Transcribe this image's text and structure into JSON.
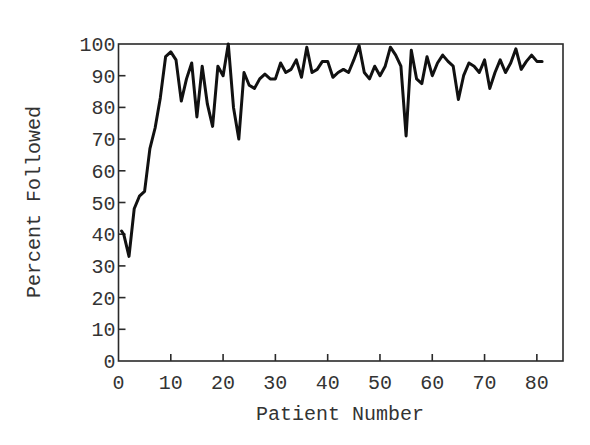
{
  "chart_data": {
    "type": "line",
    "title": "",
    "xlabel": "Patient Number",
    "ylabel": "Percent Followed",
    "xlim": [
      0,
      85
    ],
    "ylim": [
      0,
      100
    ],
    "xticks": [
      0,
      10,
      20,
      30,
      40,
      50,
      60,
      70,
      80
    ],
    "yticks": [
      0,
      10,
      20,
      30,
      40,
      50,
      60,
      70,
      80,
      90,
      100
    ],
    "grid": false,
    "legend": null,
    "series": [
      {
        "name": "Percent Followed",
        "color": "#111111",
        "x": [
          0.6,
          1,
          2,
          3,
          4,
          5,
          6,
          7,
          8,
          9,
          10,
          11,
          12,
          13,
          14,
          15,
          16,
          17,
          18,
          19,
          20,
          21,
          22,
          23,
          24,
          25,
          26,
          27,
          28,
          29,
          30,
          31,
          32,
          33,
          34,
          35,
          36,
          37,
          38,
          39,
          40,
          41,
          42,
          43,
          44,
          45,
          46,
          47,
          48,
          49,
          50,
          51,
          52,
          53,
          54,
          55,
          56,
          57,
          58,
          59,
          60,
          61,
          62,
          63,
          64,
          65,
          66,
          67,
          68,
          69,
          70,
          71,
          72,
          73,
          74,
          75,
          76,
          77,
          78,
          79,
          80,
          81
        ],
        "values": [
          41,
          40,
          33,
          48,
          52,
          53.5,
          67,
          73.5,
          83,
          96,
          97.5,
          95,
          82,
          89,
          94,
          77,
          93,
          81,
          74,
          93,
          90,
          100,
          80,
          70,
          91,
          87,
          86,
          89,
          90.5,
          89,
          89,
          94,
          91,
          92,
          95,
          89.5,
          99,
          91,
          92,
          94.5,
          94.5,
          89.5,
          91,
          92,
          91,
          95,
          99.5,
          91,
          89,
          93,
          90,
          93,
          99,
          96.5,
          93,
          71,
          98,
          89,
          87.5,
          96,
          90,
          94,
          96.5,
          94.5,
          93,
          82.5,
          90,
          94,
          93,
          91,
          95,
          86,
          91,
          95,
          91,
          94,
          98.5,
          92,
          94.5,
          96.5,
          94.5,
          94.5
        ]
      }
    ]
  },
  "axes": {
    "x_title": "Patient Number",
    "y_title": "Percent Followed",
    "x_tick_labels": [
      "0",
      "10",
      "20",
      "30",
      "40",
      "50",
      "60",
      "70",
      "80"
    ],
    "y_tick_labels": [
      "0",
      "10",
      "20",
      "30",
      "40",
      "50",
      "60",
      "70",
      "80",
      "90",
      "100"
    ]
  }
}
